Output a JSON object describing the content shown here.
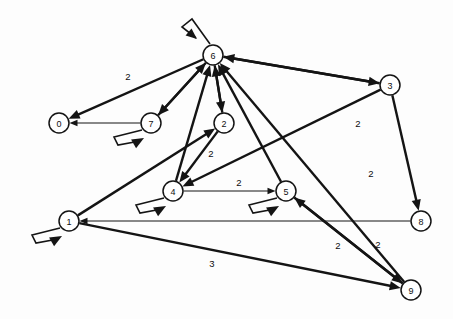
{
  "diagram": {
    "type": "directed-graph",
    "canvas": {
      "width": 453,
      "height": 319,
      "background": "#fdfdfd"
    },
    "style": {
      "edge_color": "#141414",
      "node_fill": "#ffffff",
      "node_stroke": "#141414",
      "node_radius": 10
    }
  },
  "nodes": [
    {
      "id": "0",
      "label": "0",
      "x": 59,
      "y": 123
    },
    {
      "id": "1",
      "label": "1",
      "x": 69,
      "y": 221
    },
    {
      "id": "2",
      "label": "2",
      "x": 224,
      "y": 123
    },
    {
      "id": "3",
      "label": "3",
      "x": 390,
      "y": 85
    },
    {
      "id": "4",
      "label": "4",
      "x": 173,
      "y": 191
    },
    {
      "id": "5",
      "label": "5",
      "x": 286,
      "y": 191
    },
    {
      "id": "6",
      "label": "6",
      "x": 213,
      "y": 55
    },
    {
      "id": "7",
      "label": "7",
      "x": 151,
      "y": 123
    },
    {
      "id": "8",
      "label": "8",
      "x": 421,
      "y": 221
    },
    {
      "id": "9",
      "label": "9",
      "x": 411,
      "y": 290
    }
  ],
  "edges": [
    {
      "from": "6",
      "to": "0",
      "weight": "2",
      "label_x": 128,
      "label_y": 76,
      "thick": true
    },
    {
      "from": "6",
      "to": "7",
      "weight": "",
      "label_x": 0,
      "label_y": 0,
      "thick": true
    },
    {
      "from": "6",
      "to": "2",
      "weight": "",
      "label_x": 0,
      "label_y": 0,
      "thick": true
    },
    {
      "from": "6",
      "to": "3",
      "weight": "",
      "label_x": 0,
      "label_y": 0,
      "thick": true
    },
    {
      "from": "7",
      "to": "0",
      "weight": "",
      "label_x": 0,
      "label_y": 0,
      "thick": false
    },
    {
      "from": "7",
      "to": "6",
      "weight": "",
      "label_x": 0,
      "label_y": 0,
      "thick": true
    },
    {
      "from": "4",
      "to": "6",
      "weight": "",
      "label_x": 0,
      "label_y": 0,
      "thick": true
    },
    {
      "from": "2",
      "to": "6",
      "weight": "",
      "label_x": 0,
      "label_y": 0,
      "thick": true
    },
    {
      "from": "2",
      "to": "4",
      "weight": "2",
      "label_x": 211,
      "label_y": 153,
      "thick": true
    },
    {
      "from": "1",
      "to": "2",
      "weight": "",
      "label_x": 0,
      "label_y": 0,
      "thick": true
    },
    {
      "from": "1",
      "to": "9",
      "weight": "3",
      "label_x": 212,
      "label_y": 263,
      "thick": true
    },
    {
      "from": "4",
      "to": "5",
      "weight": "2",
      "label_x": 239,
      "label_y": 182,
      "thick": false
    },
    {
      "from": "3",
      "to": "4",
      "weight": "",
      "label_x": 0,
      "label_y": 0,
      "thick": true
    },
    {
      "from": "3",
      "to": "8",
      "weight": "2",
      "label_x": 371,
      "label_y": 173,
      "thick": true
    },
    {
      "from": "3",
      "to": "6",
      "weight": "",
      "label_x": 0,
      "label_y": 0,
      "thick": true
    },
    {
      "from": "5",
      "to": "6",
      "weight": "",
      "label_x": 0,
      "label_y": 0,
      "thick": true
    },
    {
      "from": "5",
      "to": "9",
      "weight": "2",
      "label_x": 338,
      "label_y": 245,
      "thick": true
    },
    {
      "from": "9",
      "to": "6",
      "weight": "2",
      "label_x": 358,
      "label_y": 123,
      "thick": true
    },
    {
      "from": "9",
      "to": "5",
      "weight": "2",
      "label_x": 378,
      "label_y": 244,
      "thick": true
    },
    {
      "from": "8",
      "to": "1",
      "weight": "",
      "label_x": 0,
      "label_y": 0,
      "thick": false
    }
  ],
  "self_loops": [
    {
      "node": "6",
      "direction": "up-left"
    },
    {
      "node": "7",
      "direction": "down-left"
    },
    {
      "node": "4",
      "direction": "down-left"
    },
    {
      "node": "5",
      "direction": "down-left"
    },
    {
      "node": "1",
      "direction": "down-left"
    }
  ],
  "weights_visible": [
    "2",
    "2",
    "2",
    "2",
    "2",
    "2",
    "2",
    "3"
  ]
}
